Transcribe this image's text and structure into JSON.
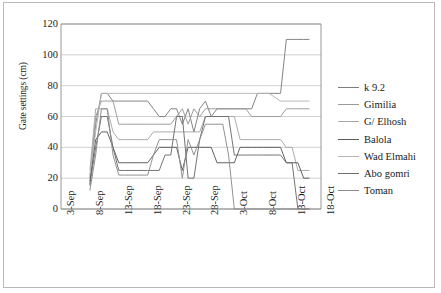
{
  "chart_data": {
    "type": "line",
    "title": "",
    "xlabel": "",
    "ylabel": "Gate settings (cm)",
    "ylim": [
      0,
      120
    ],
    "ytick_step": 20,
    "yticks": [
      "120",
      "100",
      "80",
      "60",
      "40",
      "20",
      "0"
    ],
    "grid": "horizontal",
    "legend_position": "right",
    "x_index_range": [
      0,
      45
    ],
    "categories": [
      "3-Sep",
      "8-Sep",
      "13-Sep",
      "18-Sep",
      "23-Sep",
      "28-Sep",
      "3-Oct",
      "8-Oct",
      "13-Oct",
      "18-Oct"
    ],
    "category_index": [
      0,
      5,
      10,
      15,
      20,
      25,
      30,
      35,
      40,
      45
    ],
    "series": [
      {
        "name": "k 9.2",
        "color": "#7d7d7d",
        "points": [
          [
            5,
            15
          ],
          [
            6,
            55
          ],
          [
            7,
            75
          ],
          [
            8,
            75
          ],
          [
            9,
            70
          ],
          [
            10,
            70
          ],
          [
            12,
            70
          ],
          [
            13,
            70
          ],
          [
            14,
            70
          ],
          [
            15,
            70
          ],
          [
            16,
            65
          ],
          [
            17,
            60
          ],
          [
            18,
            60
          ],
          [
            19,
            65
          ],
          [
            20,
            65
          ],
          [
            21,
            55
          ],
          [
            22,
            65
          ],
          [
            23,
            50
          ],
          [
            24,
            65
          ],
          [
            25,
            70
          ],
          [
            26,
            60
          ],
          [
            27,
            65
          ],
          [
            28,
            65
          ],
          [
            30,
            65
          ],
          [
            31,
            65
          ],
          [
            32,
            65
          ],
          [
            33,
            65
          ],
          [
            34,
            75
          ],
          [
            35,
            75
          ],
          [
            36,
            75
          ],
          [
            37,
            75
          ],
          [
            38,
            75
          ],
          [
            39,
            110
          ],
          [
            40,
            110
          ],
          [
            41,
            110
          ],
          [
            42,
            110
          ],
          [
            43,
            110
          ]
        ]
      },
      {
        "name": "Gimilia",
        "color": "#9a9a9a",
        "points": [
          [
            5,
            20
          ],
          [
            6,
            60
          ],
          [
            7,
            70
          ],
          [
            8,
            70
          ],
          [
            9,
            70
          ],
          [
            10,
            55
          ],
          [
            11,
            55
          ],
          [
            13,
            55
          ],
          [
            15,
            55
          ],
          [
            17,
            55
          ],
          [
            19,
            55
          ],
          [
            20,
            60
          ],
          [
            21,
            65
          ],
          [
            22,
            55
          ],
          [
            23,
            65
          ],
          [
            24,
            60
          ],
          [
            25,
            65
          ],
          [
            26,
            65
          ],
          [
            27,
            65
          ],
          [
            28,
            65
          ],
          [
            30,
            65
          ],
          [
            32,
            65
          ],
          [
            33,
            60
          ],
          [
            34,
            60
          ],
          [
            36,
            60
          ],
          [
            38,
            60
          ],
          [
            39,
            65
          ],
          [
            40,
            65
          ],
          [
            41,
            65
          ],
          [
            42,
            65
          ],
          [
            43,
            65
          ]
        ]
      },
      {
        "name": "G/ Elhosh",
        "color": "#a8a8a8",
        "points": [
          [
            5,
            25
          ],
          [
            6,
            65
          ],
          [
            7,
            65
          ],
          [
            8,
            65
          ],
          [
            9,
            50
          ],
          [
            10,
            45
          ],
          [
            11,
            45
          ],
          [
            13,
            45
          ],
          [
            15,
            45
          ],
          [
            16,
            50
          ],
          [
            17,
            50
          ],
          [
            18,
            50
          ],
          [
            19,
            50
          ],
          [
            20,
            50
          ],
          [
            21,
            50
          ],
          [
            22,
            50
          ],
          [
            23,
            50
          ],
          [
            24,
            50
          ],
          [
            25,
            60
          ],
          [
            26,
            60
          ],
          [
            27,
            60
          ],
          [
            28,
            60
          ],
          [
            30,
            60
          ],
          [
            31,
            45
          ],
          [
            32,
            45
          ],
          [
            33,
            45
          ],
          [
            34,
            45
          ],
          [
            36,
            45
          ],
          [
            38,
            45
          ],
          [
            39,
            40
          ],
          [
            40,
            40
          ],
          [
            41,
            25
          ],
          [
            42,
            25
          ],
          [
            43,
            25
          ]
        ]
      },
      {
        "name": "Balola",
        "color": "#5a5a5a",
        "points": [
          [
            5,
            18
          ],
          [
            6,
            45
          ],
          [
            7,
            50
          ],
          [
            8,
            50
          ],
          [
            9,
            40
          ],
          [
            10,
            30
          ],
          [
            11,
            30
          ],
          [
            13,
            30
          ],
          [
            15,
            30
          ],
          [
            16,
            35
          ],
          [
            17,
            40
          ],
          [
            18,
            40
          ],
          [
            19,
            40
          ],
          [
            20,
            40
          ],
          [
            21,
            25
          ],
          [
            22,
            40
          ],
          [
            23,
            40
          ],
          [
            24,
            40
          ],
          [
            25,
            40
          ],
          [
            26,
            40
          ],
          [
            27,
            30
          ],
          [
            28,
            30
          ],
          [
            30,
            30
          ],
          [
            31,
            40
          ],
          [
            32,
            40
          ],
          [
            33,
            40
          ],
          [
            34,
            40
          ],
          [
            35,
            40
          ],
          [
            36,
            40
          ],
          [
            37,
            40
          ],
          [
            38,
            40
          ],
          [
            39,
            30
          ],
          [
            40,
            30
          ],
          [
            41,
            30
          ],
          [
            42,
            20
          ],
          [
            43,
            20
          ]
        ]
      },
      {
        "name": "Wad Elmahi",
        "color": "#b5b5b5",
        "points": [
          [
            5,
            22
          ],
          [
            6,
            50
          ],
          [
            7,
            75
          ],
          [
            8,
            75
          ],
          [
            9,
            75
          ],
          [
            10,
            75
          ],
          [
            12,
            75
          ],
          [
            14,
            75
          ],
          [
            16,
            75
          ],
          [
            18,
            75
          ],
          [
            20,
            75
          ],
          [
            22,
            75
          ],
          [
            24,
            75
          ],
          [
            26,
            75
          ],
          [
            28,
            75
          ],
          [
            30,
            75
          ],
          [
            32,
            75
          ],
          [
            34,
            75
          ],
          [
            36,
            75
          ],
          [
            38,
            70
          ],
          [
            39,
            70
          ],
          [
            40,
            70
          ],
          [
            41,
            70
          ],
          [
            42,
            70
          ],
          [
            43,
            70
          ]
        ]
      },
      {
        "name": "Abo gomri",
        "color": "#6e6e6e",
        "points": [
          [
            5,
            16
          ],
          [
            6,
            40
          ],
          [
            7,
            60
          ],
          [
            8,
            60
          ],
          [
            9,
            40
          ],
          [
            10,
            25
          ],
          [
            11,
            25
          ],
          [
            13,
            25
          ],
          [
            15,
            25
          ],
          [
            17,
            25
          ],
          [
            18,
            35
          ],
          [
            19,
            35
          ],
          [
            20,
            60
          ],
          [
            21,
            60
          ],
          [
            22,
            20
          ],
          [
            23,
            20
          ],
          [
            24,
            45
          ],
          [
            25,
            60
          ],
          [
            26,
            60
          ],
          [
            27,
            60
          ],
          [
            28,
            60
          ],
          [
            29,
            60
          ],
          [
            30,
            35
          ],
          [
            31,
            35
          ],
          [
            32,
            35
          ],
          [
            33,
            35
          ],
          [
            34,
            35
          ],
          [
            35,
            35
          ],
          [
            36,
            35
          ],
          [
            37,
            35
          ],
          [
            38,
            35
          ],
          [
            39,
            30
          ],
          [
            40,
            30
          ],
          [
            41,
            0
          ],
          [
            42,
            0
          ],
          [
            43,
            0
          ]
        ]
      },
      {
        "name": "Toman",
        "color": "#8c8c8c",
        "points": [
          [
            5,
            12
          ],
          [
            6,
            35
          ],
          [
            7,
            65
          ],
          [
            8,
            65
          ],
          [
            9,
            35
          ],
          [
            10,
            22
          ],
          [
            11,
            22
          ],
          [
            13,
            22
          ],
          [
            15,
            22
          ],
          [
            16,
            35
          ],
          [
            17,
            45
          ],
          [
            18,
            45
          ],
          [
            19,
            45
          ],
          [
            20,
            45
          ],
          [
            21,
            20
          ],
          [
            22,
            45
          ],
          [
            23,
            35
          ],
          [
            24,
            45
          ],
          [
            25,
            55
          ],
          [
            26,
            55
          ],
          [
            27,
            55
          ],
          [
            28,
            55
          ],
          [
            29,
            35
          ],
          [
            30,
            0
          ],
          [
            31,
            0
          ],
          [
            32,
            0
          ],
          [
            33,
            0
          ],
          [
            34,
            0
          ],
          [
            35,
            0
          ],
          [
            36,
            0
          ],
          [
            37,
            0
          ],
          [
            38,
            0
          ],
          [
            39,
            0
          ],
          [
            40,
            0
          ],
          [
            41,
            0
          ],
          [
            42,
            0
          ],
          [
            43,
            0
          ]
        ]
      }
    ]
  }
}
